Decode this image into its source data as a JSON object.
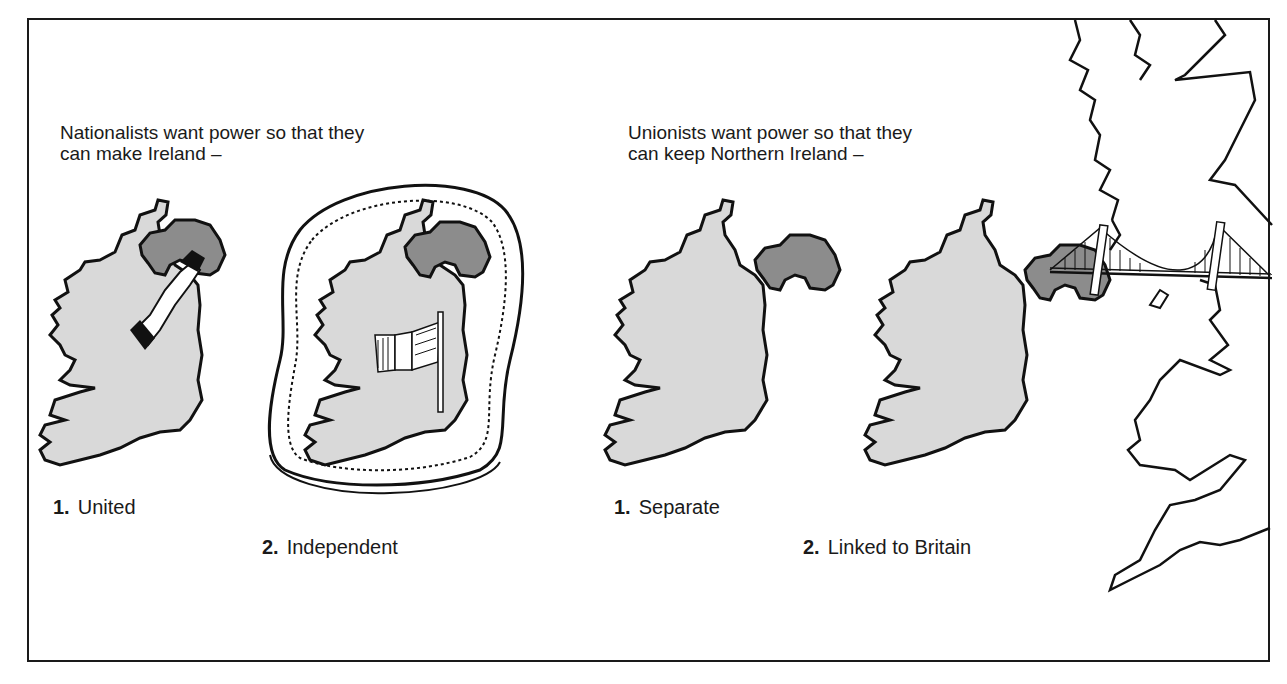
{
  "figure": {
    "colors": {
      "frame": "#1a1a1a",
      "republic_fill": "#d9d9d9",
      "northern_ireland_fill": "#8c8c8c",
      "outline": "#111111"
    },
    "nationalists": {
      "heading_line1": "Nationalists want power so that they",
      "heading_line2": "can make Ireland –",
      "options": [
        {
          "number": "1.",
          "label": "United",
          "icon": "handshake-icon"
        },
        {
          "number": "2.",
          "label": "Independent",
          "icon": "tricolour-flag-icon"
        }
      ]
    },
    "unionists": {
      "heading_line1": "Unionists want power so that they",
      "heading_line2": "can keep Northern Ireland –",
      "options": [
        {
          "number": "1.",
          "label": "Separate",
          "icon": "separated-map-icon"
        },
        {
          "number": "2.",
          "label": "Linked to Britain",
          "icon": "suspension-bridge-icon"
        }
      ]
    }
  }
}
